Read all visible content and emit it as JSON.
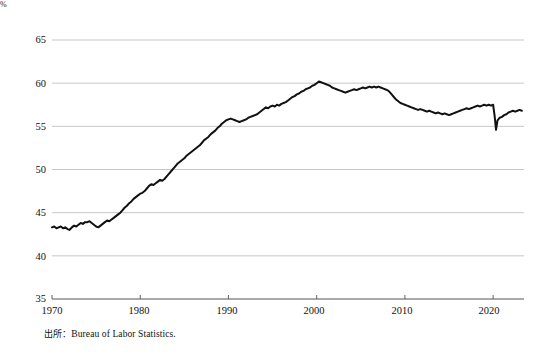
{
  "figure": {
    "unit_label": "%",
    "source_note_prefix": "出所",
    "source_note_separator": "：",
    "source_note_text": "Bureau of Labor Statistics."
  },
  "chart_data": {
    "type": "line",
    "title": "",
    "subtitle": "",
    "xlabel": "",
    "ylabel": "%",
    "ylim": [
      35,
      65
    ],
    "xlim": [
      1970,
      2023.5
    ],
    "yticks": [
      35,
      40,
      45,
      50,
      55,
      60,
      65
    ],
    "xticks": [
      1970,
      1980,
      1990,
      2000,
      2010,
      2020
    ],
    "grid": "horizontal",
    "legend": "none",
    "line_color": "#111111",
    "line_width": 2.0,
    "series": [
      {
        "name": "Labor force participation rate",
        "x": [
          1970.0,
          1970.25,
          1970.5,
          1970.75,
          1971.0,
          1971.25,
          1971.5,
          1971.75,
          1972.0,
          1972.25,
          1972.5,
          1972.75,
          1973.0,
          1973.25,
          1973.5,
          1973.75,
          1974.0,
          1974.25,
          1974.5,
          1974.75,
          1975.0,
          1975.25,
          1975.5,
          1975.75,
          1976.0,
          1976.25,
          1976.5,
          1976.75,
          1977.0,
          1977.25,
          1977.5,
          1977.75,
          1978.0,
          1978.25,
          1978.5,
          1978.75,
          1979.0,
          1979.25,
          1979.5,
          1979.75,
          1980.0,
          1980.25,
          1980.5,
          1980.75,
          1981.0,
          1981.25,
          1981.5,
          1981.75,
          1982.0,
          1982.25,
          1982.5,
          1982.75,
          1983.0,
          1983.25,
          1983.5,
          1983.75,
          1984.0,
          1984.25,
          1984.5,
          1984.75,
          1985.0,
          1985.25,
          1985.5,
          1985.75,
          1986.0,
          1986.25,
          1986.5,
          1986.75,
          1987.0,
          1987.25,
          1987.5,
          1987.75,
          1988.0,
          1988.25,
          1988.5,
          1988.75,
          1989.0,
          1989.25,
          1989.5,
          1989.75,
          1990.0,
          1990.25,
          1990.5,
          1990.75,
          1991.0,
          1991.25,
          1991.5,
          1991.75,
          1992.0,
          1992.25,
          1992.5,
          1992.75,
          1993.0,
          1993.25,
          1993.5,
          1993.75,
          1994.0,
          1994.25,
          1994.5,
          1994.75,
          1995.0,
          1995.25,
          1995.5,
          1995.75,
          1996.0,
          1996.25,
          1996.5,
          1996.75,
          1997.0,
          1997.25,
          1997.5,
          1997.75,
          1998.0,
          1998.25,
          1998.5,
          1998.75,
          1999.0,
          1999.25,
          1999.5,
          1999.75,
          2000.0,
          2000.25,
          2000.5,
          2000.75,
          2001.0,
          2001.25,
          2001.5,
          2001.75,
          2002.0,
          2002.25,
          2002.5,
          2002.75,
          2003.0,
          2003.25,
          2003.5,
          2003.75,
          2004.0,
          2004.25,
          2004.5,
          2004.75,
          2005.0,
          2005.25,
          2005.5,
          2005.75,
          2006.0,
          2006.25,
          2006.5,
          2006.75,
          2007.0,
          2007.25,
          2007.5,
          2007.75,
          2008.0,
          2008.25,
          2008.5,
          2008.75,
          2009.0,
          2009.25,
          2009.5,
          2009.75,
          2010.0,
          2010.25,
          2010.5,
          2010.75,
          2011.0,
          2011.25,
          2011.5,
          2011.75,
          2012.0,
          2012.25,
          2012.5,
          2012.75,
          2013.0,
          2013.25,
          2013.5,
          2013.75,
          2014.0,
          2014.25,
          2014.5,
          2014.75,
          2015.0,
          2015.25,
          2015.5,
          2015.75,
          2016.0,
          2016.25,
          2016.5,
          2016.75,
          2017.0,
          2017.25,
          2017.5,
          2017.75,
          2018.0,
          2018.25,
          2018.5,
          2018.75,
          2019.0,
          2019.25,
          2019.5,
          2019.75,
          2020.0,
          2020.17,
          2020.33,
          2020.42,
          2020.5,
          2020.75,
          2021.0,
          2021.25,
          2021.5,
          2021.75,
          2022.0,
          2022.25,
          2022.5,
          2022.75,
          2023.0,
          2023.25
        ],
        "values": [
          43.3,
          43.4,
          43.2,
          43.3,
          43.4,
          43.2,
          43.3,
          43.1,
          43.0,
          43.3,
          43.5,
          43.4,
          43.6,
          43.8,
          43.7,
          43.9,
          43.9,
          44.0,
          43.8,
          43.6,
          43.4,
          43.3,
          43.5,
          43.7,
          43.9,
          44.1,
          44.0,
          44.2,
          44.4,
          44.6,
          44.8,
          45.0,
          45.3,
          45.6,
          45.8,
          46.1,
          46.3,
          46.6,
          46.8,
          47.0,
          47.2,
          47.3,
          47.5,
          47.8,
          48.1,
          48.3,
          48.2,
          48.4,
          48.6,
          48.8,
          48.7,
          48.9,
          49.2,
          49.5,
          49.8,
          50.1,
          50.4,
          50.7,
          50.9,
          51.1,
          51.3,
          51.6,
          51.8,
          52.0,
          52.2,
          52.4,
          52.6,
          52.8,
          53.1,
          53.4,
          53.6,
          53.8,
          54.1,
          54.3,
          54.5,
          54.8,
          55.0,
          55.3,
          55.5,
          55.7,
          55.8,
          55.9,
          55.8,
          55.7,
          55.6,
          55.5,
          55.6,
          55.7,
          55.8,
          56.0,
          56.1,
          56.2,
          56.3,
          56.4,
          56.6,
          56.8,
          57.0,
          57.2,
          57.1,
          57.3,
          57.4,
          57.3,
          57.5,
          57.4,
          57.6,
          57.7,
          57.8,
          58.0,
          58.2,
          58.4,
          58.5,
          58.7,
          58.8,
          59.0,
          59.1,
          59.3,
          59.4,
          59.5,
          59.7,
          59.8,
          60.0,
          60.2,
          60.1,
          60.0,
          59.9,
          59.8,
          59.7,
          59.5,
          59.4,
          59.3,
          59.2,
          59.1,
          59.0,
          58.9,
          59.0,
          59.1,
          59.2,
          59.3,
          59.2,
          59.3,
          59.4,
          59.5,
          59.4,
          59.5,
          59.6,
          59.5,
          59.6,
          59.5,
          59.6,
          59.5,
          59.4,
          59.3,
          59.2,
          59.0,
          58.7,
          58.4,
          58.1,
          57.9,
          57.7,
          57.6,
          57.5,
          57.4,
          57.3,
          57.2,
          57.1,
          57.0,
          56.9,
          57.0,
          56.9,
          56.8,
          56.7,
          56.8,
          56.7,
          56.6,
          56.5,
          56.6,
          56.5,
          56.4,
          56.5,
          56.4,
          56.3,
          56.4,
          56.5,
          56.6,
          56.7,
          56.8,
          56.9,
          57.0,
          57.1,
          57.0,
          57.1,
          57.2,
          57.3,
          57.4,
          57.3,
          57.4,
          57.5,
          57.4,
          57.5,
          57.4,
          57.5,
          56.2,
          54.6,
          55.2,
          55.7,
          56.0,
          56.1,
          56.3,
          56.4,
          56.6,
          56.7,
          56.8,
          56.7,
          56.8,
          56.9,
          56.8
        ]
      }
    ]
  },
  "axes": {
    "y_tick_labels": [
      "65",
      "60",
      "55",
      "50",
      "45",
      "40",
      "35"
    ],
    "x_tick_labels": [
      "1970",
      "1980",
      "1990",
      "2000",
      "2010",
      "2020"
    ]
  }
}
